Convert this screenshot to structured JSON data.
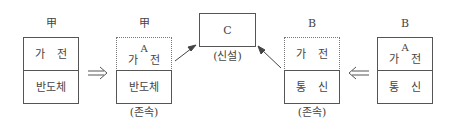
{
  "diagram": {
    "nodes": [
      {
        "id": "box1",
        "owner_label": "甲",
        "top": {
          "sub": "",
          "left": "가",
          "right": "전"
        },
        "bottom": {
          "text": "반도체"
        },
        "top_style": "solid",
        "caption": ""
      },
      {
        "id": "box2",
        "owner_label": "甲",
        "top": {
          "sub": "A",
          "left": "가",
          "right": "전"
        },
        "bottom": {
          "text": "반도체"
        },
        "top_style": "dotted",
        "caption": "(존속)"
      },
      {
        "id": "box3",
        "label": "C",
        "caption": "(신설)"
      },
      {
        "id": "box4",
        "owner_label": "B",
        "top": {
          "sub": "",
          "left": "가",
          "right": "전"
        },
        "bottom": {
          "left": "통",
          "right": "신"
        },
        "top_style": "dotted",
        "caption": "(존속)"
      },
      {
        "id": "box5",
        "owner_label": "B",
        "top": {
          "sub": "A",
          "left": "가",
          "right": "전"
        },
        "bottom": {
          "left": "통",
          "right": "신"
        },
        "top_style": "solid",
        "caption": ""
      }
    ],
    "arrows": [
      {
        "from": "box1",
        "to": "box2",
        "glyph": "double-right"
      },
      {
        "from": "box2",
        "to": "box3",
        "glyph": "single-diagonal"
      },
      {
        "from": "box4",
        "to": "box3",
        "glyph": "single-diagonal"
      },
      {
        "from": "box5",
        "to": "box4",
        "glyph": "double-left"
      }
    ],
    "colors": {
      "line": "#555555",
      "text": "#444444"
    }
  }
}
